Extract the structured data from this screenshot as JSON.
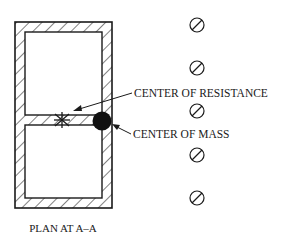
{
  "diagram": {
    "caption": "PLAN AT A–A",
    "labels": {
      "center_of_resistance": "CENTER OF RESISTANCE",
      "center_of_mass": "CENTER OF MASS"
    },
    "symbols": {
      "center_of_resistance": "asterisk-star",
      "center_of_mass": "filled-circle",
      "columns": "circle-slash"
    },
    "columns_count": 5,
    "colors": {
      "line": "#1a1a1a",
      "background": "#ffffff"
    }
  }
}
